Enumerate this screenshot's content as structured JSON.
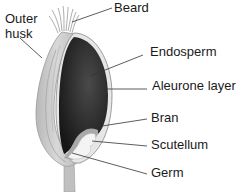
{
  "diagram": {
    "labels": {
      "outer_husk_line1": "Outer",
      "outer_husk_line2": "husk",
      "beard": "Beard",
      "endosperm": "Endosperm",
      "aleurone": "Aleurone layer",
      "bran": "Bran",
      "scutellum": "Scutellum",
      "germ": "Germ"
    },
    "colors": {
      "husk": "#c8c8c8",
      "husk_edge": "#9a9a9a",
      "endosperm": "#2a2a2a",
      "germ": "#f0f0f0",
      "scutellum": "#a8a8a8",
      "line": "#333333",
      "text": "#1a1a1a"
    }
  }
}
